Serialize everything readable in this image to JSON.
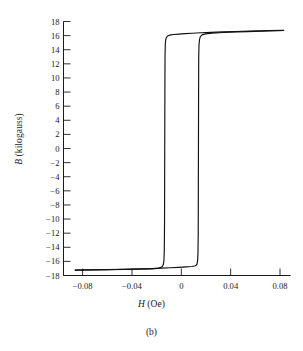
{
  "figure": {
    "caption": "(b)"
  },
  "chart_data": {
    "type": "line",
    "title": "",
    "subtitle": "",
    "xlabel_symbol": "H",
    "xlabel_unit": " (Oe)",
    "xlabel": "H (Oe)",
    "ylabel_symbol": "B",
    "ylabel_unit": " (kilogauss)",
    "ylabel": "B (kilogauss)",
    "grid": false,
    "legend": null,
    "xlim": [
      -0.0955,
      0.0885
    ],
    "ylim": [
      -18,
      18
    ],
    "xticks": [
      -0.08,
      -0.04,
      0,
      0.04,
      0.08
    ],
    "xticklabels": [
      "−0.08",
      "−0.04",
      "0",
      "0.04",
      "0.08"
    ],
    "yticks": [
      18,
      16,
      14,
      12,
      10,
      8,
      6,
      4,
      2,
      0,
      -2,
      -4,
      -6,
      -8,
      -10,
      -12,
      -14,
      -16,
      -18
    ],
    "yticklabels": [
      "18",
      "16",
      "14",
      "12",
      "10",
      "8",
      "6",
      "4",
      "2",
      "0",
      "−2",
      "−4",
      "−6",
      "−8",
      "−10",
      "−12",
      "−14",
      "−16",
      "−18"
    ],
    "annotations": {
      "saturation_positive": 16.7,
      "saturation_negative": -17.2,
      "coercivity_negative": -0.0132,
      "coercivity_positive": 0.0132,
      "remanence_upper": 16.2,
      "remanence_lower": -16.6
    },
    "series": [
      {
        "name": "descending-branch",
        "points": [
          [
            0.083,
            16.75
          ],
          [
            0.07,
            16.7
          ],
          [
            0.056,
            16.64
          ],
          [
            0.044,
            16.58
          ],
          [
            0.033,
            16.52
          ],
          [
            0.024,
            16.46
          ],
          [
            0.016,
            16.4
          ],
          [
            0.009,
            16.34
          ],
          [
            0.003,
            16.28
          ],
          [
            -0.002,
            16.22
          ],
          [
            -0.006,
            16.16
          ],
          [
            -0.0085,
            16.1
          ],
          [
            -0.0102,
            16.02
          ],
          [
            -0.0114,
            15.9
          ],
          [
            -0.0122,
            15.7
          ],
          [
            -0.0127,
            15.35
          ],
          [
            -0.013,
            14.7
          ],
          [
            -0.0132,
            13.0
          ],
          [
            -0.0133,
            9.0
          ],
          [
            -0.0134,
            3.0
          ],
          [
            -0.0135,
            -4.0
          ],
          [
            -0.0136,
            -10.5
          ],
          [
            -0.0138,
            -14.4
          ],
          [
            -0.0141,
            -15.9
          ],
          [
            -0.0146,
            -16.45
          ],
          [
            -0.0154,
            -16.72
          ],
          [
            -0.0168,
            -16.88
          ],
          [
            -0.0195,
            -17.0
          ],
          [
            -0.025,
            -17.06
          ],
          [
            -0.034,
            -17.1
          ],
          [
            -0.046,
            -17.14
          ],
          [
            -0.06,
            -17.18
          ],
          [
            -0.074,
            -17.21
          ],
          [
            -0.086,
            -17.23
          ]
        ]
      },
      {
        "name": "ascending-branch",
        "points": [
          [
            -0.086,
            -17.23
          ],
          [
            -0.074,
            -17.2
          ],
          [
            -0.06,
            -17.16
          ],
          [
            -0.046,
            -17.12
          ],
          [
            -0.034,
            -17.07
          ],
          [
            -0.024,
            -17.02
          ],
          [
            -0.016,
            -16.96
          ],
          [
            -0.009,
            -16.9
          ],
          [
            -0.002,
            -16.84
          ],
          [
            0.004,
            -16.78
          ],
          [
            0.0085,
            -16.72
          ],
          [
            0.0108,
            -16.66
          ],
          [
            0.012,
            -16.56
          ],
          [
            0.0128,
            -16.35
          ],
          [
            0.0132,
            -15.9
          ],
          [
            0.0135,
            -14.9
          ],
          [
            0.0137,
            -12.0
          ],
          [
            0.0138,
            -6.0
          ],
          [
            0.0139,
            1.0
          ],
          [
            0.014,
            8.0
          ],
          [
            0.0141,
            12.8
          ],
          [
            0.0143,
            14.6
          ],
          [
            0.0147,
            15.4
          ],
          [
            0.0154,
            15.85
          ],
          [
            0.0168,
            16.1
          ],
          [
            0.0195,
            16.25
          ],
          [
            0.025,
            16.36
          ],
          [
            0.034,
            16.44
          ],
          [
            0.046,
            16.52
          ],
          [
            0.06,
            16.6
          ],
          [
            0.07,
            16.66
          ],
          [
            0.083,
            16.73
          ]
        ]
      }
    ]
  }
}
